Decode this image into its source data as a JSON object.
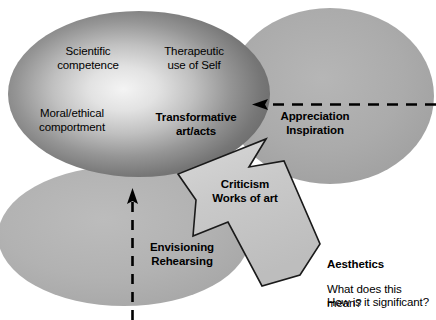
{
  "diagram": {
    "regions": {
      "main_ellipse": {
        "name": "transformative-art-acts-domain",
        "fill_edge": "#6a6a6a",
        "fill_center": "#f2f2f2",
        "labels": [
          {
            "id": "scientific",
            "text": "Scientific\ncompetence",
            "bold": false
          },
          {
            "id": "therapeutic",
            "text": "Therapeutic\nuse of Self",
            "bold": false
          },
          {
            "id": "moral",
            "text": "Moral/ethical\ncomportment",
            "bold": false
          },
          {
            "id": "transformative",
            "text": "Transformative\nart/acts",
            "bold": true
          }
        ]
      },
      "right_ellipse": {
        "name": "appreciation-inspiration-domain",
        "fill": "#a8a8a8",
        "labels": [
          {
            "id": "appreciation",
            "text": "Appreciation\nInspiration",
            "bold": true
          }
        ]
      },
      "bottom_ellipse": {
        "name": "envisioning-rehearsing-domain",
        "fill": "#b0b0b0",
        "labels": [
          {
            "id": "envisioning",
            "text": "Envisioning\nRehearsing",
            "bold": true
          }
        ]
      },
      "arrow_block": {
        "name": "criticism-works-of-art-arrow",
        "fill": "#c8c8c8",
        "stroke": "#1a1a1a",
        "labels": [
          {
            "id": "criticism",
            "text": "Criticism\nWorks of art",
            "bold": true
          }
        ]
      }
    },
    "connectors": [
      {
        "id": "appreciation-arrow",
        "style": "dashed",
        "direction": "right-to-left",
        "color": "#000000"
      },
      {
        "id": "envisioning-arrow",
        "style": "dashed",
        "direction": "bottom-to-top",
        "color": "#000000"
      }
    ],
    "caption": {
      "heading": "Aesthetics",
      "line1": "What does this mean?",
      "line2": "How is it significant?"
    }
  }
}
